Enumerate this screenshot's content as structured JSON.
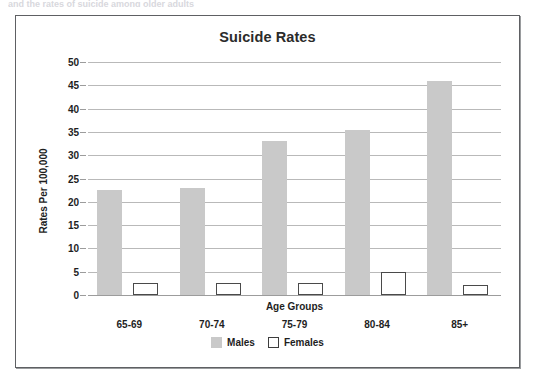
{
  "scan_artifact_text": "and the rates of suicide among older adults",
  "chart_data": {
    "type": "bar",
    "title": "Suicide Rates",
    "xlabel": "Age Groups",
    "ylabel": "Rates Per 100,000",
    "categories": [
      "65-69",
      "70-74",
      "75-79",
      "80-84",
      "85+"
    ],
    "series": [
      {
        "name": "Males",
        "values": [
          22.5,
          23.0,
          33.0,
          35.5,
          46.0
        ]
      },
      {
        "name": "Females",
        "values": [
          2.6,
          2.5,
          2.6,
          4.9,
          2.2
        ]
      }
    ],
    "ylim": [
      0,
      50
    ],
    "yticks": [
      0,
      5,
      10,
      15,
      20,
      25,
      30,
      35,
      40,
      45,
      50
    ],
    "grid": true,
    "legend_position": "bottom",
    "colors": {
      "males": "#c9c9c9",
      "females": "#ffffff",
      "females_border": "#4a4a4a",
      "gridline": "#b9b9b9",
      "text": "#1e1e1e",
      "frame": "#5e6063"
    }
  }
}
